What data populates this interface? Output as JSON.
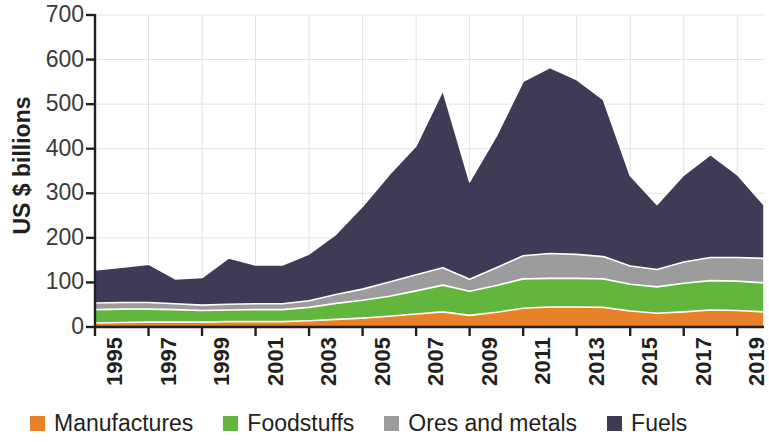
{
  "chart_data": {
    "type": "area",
    "stacked": true,
    "title": "",
    "subtitle": "",
    "xlabel": "",
    "ylabel": "US $ billions",
    "ylim": [
      0,
      700
    ],
    "ytick_values": [
      0,
      100,
      200,
      300,
      400,
      500,
      600,
      700
    ],
    "ytick_labels": [
      "0",
      "100",
      "200",
      "300",
      "400",
      "500",
      "600",
      "700"
    ],
    "xlim": [
      1995,
      2020
    ],
    "xtick_values": [
      1995,
      1997,
      1999,
      2001,
      2003,
      2005,
      2007,
      2009,
      2011,
      2013,
      2015,
      2017,
      2019
    ],
    "xtick_labels": [
      "1995",
      "1997",
      "1999",
      "2001",
      "2003",
      "2005",
      "2007",
      "2009",
      "2011",
      "2013",
      "2015",
      "2017",
      "2019"
    ],
    "grid": true,
    "grid_axis": "both",
    "legend_position": "bottom",
    "x": [
      1995,
      1996,
      1997,
      1998,
      1999,
      2000,
      2001,
      2002,
      2003,
      2004,
      2005,
      2006,
      2007,
      2008,
      2009,
      2010,
      2011,
      2012,
      2013,
      2014,
      2015,
      2016,
      2017,
      2018,
      2019,
      2020
    ],
    "series": [
      {
        "name": "Manufactures",
        "color": "#E8812A",
        "values": [
          9,
          10,
          11,
          11,
          11,
          12,
          12,
          12,
          14,
          17,
          20,
          24,
          29,
          34,
          26,
          33,
          42,
          45,
          45,
          44,
          36,
          31,
          34,
          38,
          37,
          34
        ]
      },
      {
        "name": "Foodstuffs",
        "color": "#63B63C",
        "values": [
          30,
          30,
          29,
          28,
          26,
          26,
          27,
          27,
          30,
          36,
          40,
          45,
          52,
          60,
          54,
          60,
          66,
          64,
          64,
          64,
          60,
          59,
          64,
          66,
          66,
          65
        ]
      },
      {
        "name": "Ores and metals",
        "color": "#9C9C9C",
        "values": [
          15,
          15,
          15,
          13,
          12,
          13,
          13,
          13,
          15,
          20,
          25,
          32,
          36,
          39,
          27,
          40,
          52,
          56,
          54,
          50,
          41,
          39,
          48,
          52,
          53,
          55
        ]
      },
      {
        "name": "Fuels",
        "color": "#3E3B56",
        "values": [
          74,
          79,
          86,
          56,
          62,
          104,
          87,
          87,
          105,
          135,
          186,
          241,
          290,
          398,
          219,
          296,
          391,
          417,
          392,
          352,
          203,
          146,
          195,
          231,
          186,
          120
        ]
      }
    ],
    "totals": [
      128,
      134,
      141,
      108,
      111,
      155,
      139,
      139,
      164,
      208,
      271,
      342,
      407,
      531,
      326,
      429,
      551,
      582,
      555,
      510,
      340,
      275,
      341,
      387,
      342,
      274
    ]
  },
  "axes": {
    "y_title": "US $ billions"
  },
  "legend": {
    "items": [
      {
        "label": "Manufactures",
        "color": "#E8812A"
      },
      {
        "label": "Foodstuffs",
        "color": "#63B63C"
      },
      {
        "label": "Ores and metals",
        "color": "#9C9C9C"
      },
      {
        "label": "Fuels",
        "color": "#3E3B56"
      }
    ]
  },
  "style": {
    "axis_color": "#231f20",
    "grid_color": "#e2e2e2",
    "background": "#ffffff"
  }
}
